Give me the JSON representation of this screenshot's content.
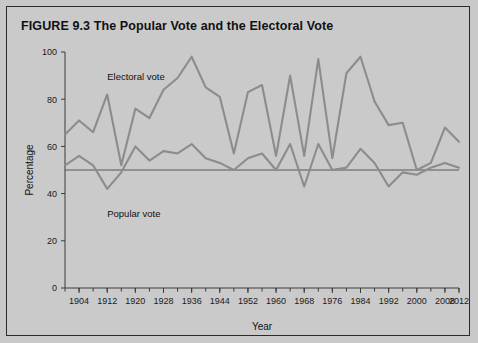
{
  "figure": {
    "label": "FIGURE 9.3",
    "title": "The Popular Vote and the Electoral Vote",
    "background_color": "#cacaca",
    "border_color": "#2b2b2b",
    "line_color": "#8c8c8c",
    "text_color": "#111111"
  },
  "chart_data": {
    "type": "line",
    "title": "The Popular Vote and the Electoral Vote",
    "xlabel": "Year",
    "ylabel": "Percentage",
    "xlim": [
      1900,
      2012
    ],
    "ylim": [
      0,
      100
    ],
    "yticks": [
      0,
      20,
      40,
      60,
      80,
      100
    ],
    "xticks": [
      1904,
      1912,
      1920,
      1928,
      1936,
      1944,
      1952,
      1960,
      1968,
      1976,
      1984,
      1992,
      2000,
      2008,
      2012
    ],
    "xtick_step": 8,
    "xminor_step": 4,
    "grid": false,
    "legend_position": "inline-annotations",
    "reference_line": {
      "y": 50,
      "label": "50 percent"
    },
    "x": [
      1900,
      1904,
      1908,
      1912,
      1916,
      1920,
      1924,
      1928,
      1932,
      1936,
      1940,
      1944,
      1948,
      1952,
      1956,
      1960,
      1964,
      1968,
      1972,
      1976,
      1980,
      1984,
      1988,
      1992,
      1996,
      2000,
      2004,
      2008,
      2012
    ],
    "series": [
      {
        "name": "Electoral vote",
        "label": "Electoral vote",
        "color": "#8c8c8c",
        "values": [
          65,
          71,
          66,
          82,
          52,
          76,
          72,
          84,
          89,
          98,
          85,
          81,
          57,
          83,
          86,
          56,
          90,
          56,
          97,
          55,
          91,
          98,
          79,
          69,
          70,
          50,
          53,
          68,
          62
        ]
      },
      {
        "name": "Popular vote",
        "label": "Popular vote",
        "color": "#8c8c8c",
        "values": [
          52,
          56,
          52,
          42,
          49,
          60,
          54,
          58,
          57,
          61,
          55,
          53,
          50,
          55,
          57,
          50,
          61,
          43,
          61,
          50,
          51,
          59,
          53,
          43,
          49,
          48,
          51,
          53,
          51
        ]
      }
    ],
    "annotations": [
      {
        "text": "Electoral vote",
        "x": 1912,
        "y": 88
      },
      {
        "text": "Popular vote",
        "x": 1912,
        "y": 30
      }
    ]
  }
}
